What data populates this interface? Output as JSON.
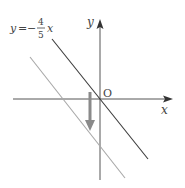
{
  "diagram": {
    "equation_label": {
      "lhs": "y",
      "eq": "=",
      "minus": "−",
      "numerator": "4",
      "denominator": "5",
      "var": "x"
    },
    "axes": {
      "x_label": "x",
      "y_label": "y",
      "origin_label": "O"
    },
    "lines": [
      {
        "name": "original-line",
        "equation": "y = -4/5 x",
        "color": "#3a3a3a"
      },
      {
        "name": "translated-line",
        "color": "#a8a8a8"
      }
    ],
    "arrow": {
      "direction": "down",
      "color": "#8a8a8a"
    },
    "colors": {
      "axis": "#555555",
      "text": "#444444"
    }
  }
}
